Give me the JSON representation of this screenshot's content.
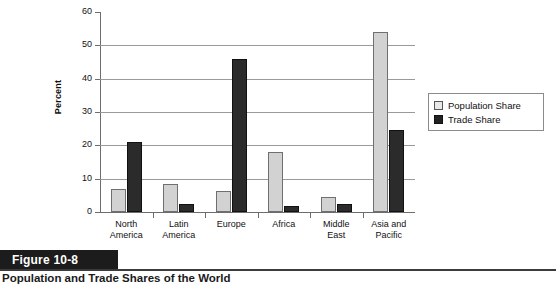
{
  "figure": {
    "banner_label": "Figure 10-8",
    "caption_title": "Population and Trade Shares of the World"
  },
  "chart_data": {
    "type": "bar",
    "title": "",
    "xlabel": "",
    "ylabel": "Percent",
    "ylim": [
      0,
      60
    ],
    "yticks": [
      0,
      10,
      20,
      30,
      40,
      50,
      60
    ],
    "ytick_labels": [
      "0",
      "10",
      "20",
      "30",
      "40",
      "50",
      "60"
    ],
    "grid": true,
    "grid_axis": "y",
    "legend_position": "right",
    "categories": [
      "North America",
      "Latin America",
      "Europe",
      "Africa",
      "Middle East",
      "Asia and Pacific"
    ],
    "category_lines": [
      [
        "North",
        "America"
      ],
      [
        "Latin",
        "America"
      ],
      [
        "Europe",
        ""
      ],
      [
        "Africa",
        ""
      ],
      [
        "Middle",
        "East"
      ],
      [
        "Asia and",
        "Pacific"
      ]
    ],
    "series": [
      {
        "name": "Population Share",
        "color": "#d2d2d2",
        "values": [
          7,
          8.3,
          6.2,
          18,
          4.6,
          54
        ]
      },
      {
        "name": "Trade Share",
        "color": "#2b2b2b",
        "values": [
          21,
          2.5,
          46,
          1.8,
          2.3,
          24.5
        ]
      }
    ]
  },
  "legend": {
    "items": [
      {
        "label": "Population Share",
        "swatch": "light-gray-square-icon"
      },
      {
        "label": "Trade Share",
        "swatch": "black-square-icon"
      }
    ]
  }
}
